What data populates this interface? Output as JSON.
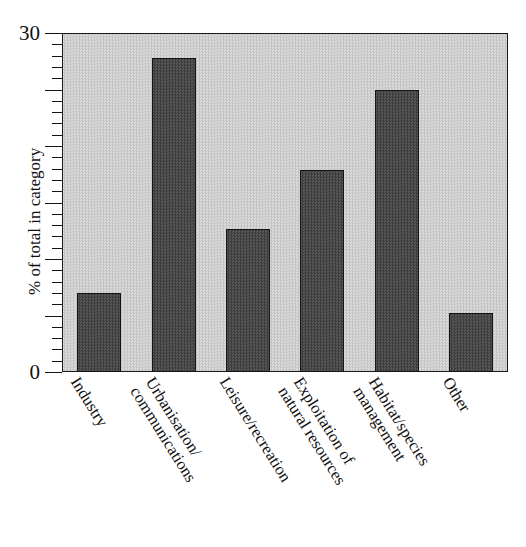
{
  "caption_fragment": "",
  "chart_data": {
    "type": "bar",
    "title": "",
    "subtitle": "",
    "xlabel": "",
    "ylabel": "% of total in category",
    "ylim": [
      0,
      30
    ],
    "y_tick_labels": [
      "0",
      "30"
    ],
    "y_major_tick_interval": 5,
    "y_minor_tick_interval": 1,
    "grid": false,
    "legend": null,
    "bar_color": "#4a4a4a",
    "bar_edge_color": "#141414",
    "plot_background_color": "#cfcfcf",
    "categories": [
      "Industry",
      "Urbanisation/ communications",
      "Leisure/recreation",
      "Exploitation of natural resources",
      "Habitat/species management",
      "Other"
    ],
    "category_lines": [
      [
        "Industry"
      ],
      [
        "Urbanisation/",
        "communications"
      ],
      [
        "Leisure/recreation"
      ],
      [
        "Exploitation of",
        "natural resources"
      ],
      [
        "Habitat/species",
        "management"
      ],
      [
        "Other"
      ]
    ],
    "values": [
      7.0,
      27.8,
      12.7,
      17.9,
      25.0,
      5.2
    ]
  }
}
